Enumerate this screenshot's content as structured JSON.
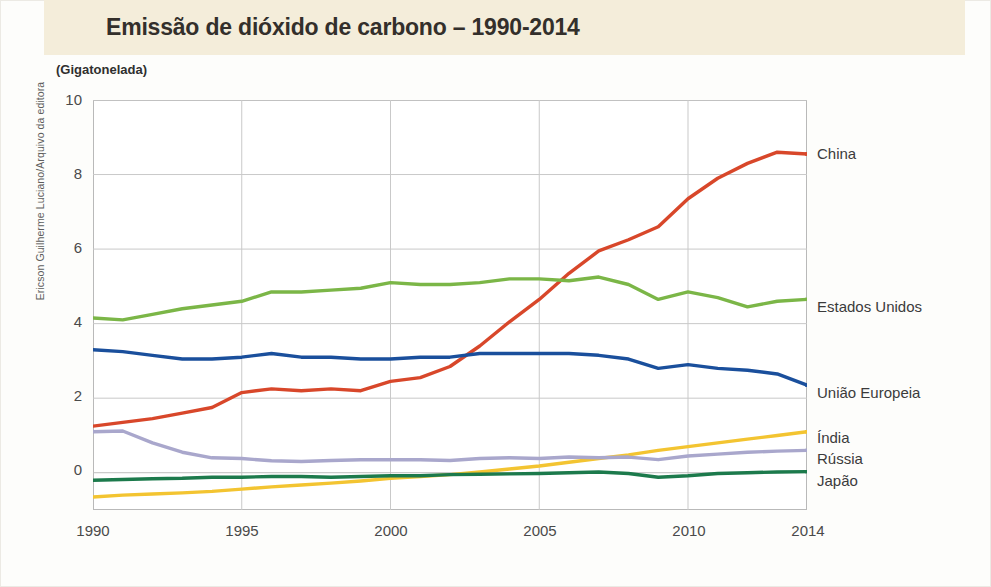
{
  "header": {
    "title": "Emissão de dióxido de carbono – 1990-2014",
    "band_color": "#f4edda"
  },
  "credit": "Ericson Guilherme Luciano/Arquivo da editora",
  "unit_caption": "(Gigatonelada)",
  "axis": {
    "y_ticks": [
      "0",
      "2",
      "4",
      "6",
      "8",
      "10"
    ],
    "x_ticks": [
      "1990",
      "1995",
      "2000",
      "2005",
      "2010",
      "2014"
    ]
  },
  "series_labels": {
    "china": "China",
    "estados_unidos": "Estados Unidos",
    "uniao_europeia": "União Europeia",
    "india": "Índia",
    "russia": "Rússia",
    "japao": "Japão"
  },
  "chart_data": {
    "type": "line",
    "title": "Emissão de dióxido de carbono – 1990-2014",
    "subtitle": "(Gigatonelada)",
    "xlabel": "",
    "ylabel": "(Gigatonelada)",
    "xlim": [
      1990,
      2014
    ],
    "ylim": [
      -1.0,
      10
    ],
    "yticks": [
      0,
      2,
      4,
      6,
      8,
      10
    ],
    "xticks": [
      1990,
      1995,
      2000,
      2005,
      2010,
      2014
    ],
    "grid": true,
    "legend_position": "right-inline-labels",
    "x": [
      1990,
      1991,
      1992,
      1993,
      1994,
      1995,
      1996,
      1997,
      1998,
      1999,
      2000,
      2001,
      2002,
      2003,
      2004,
      2005,
      2006,
      2007,
      2008,
      2009,
      2010,
      2011,
      2012,
      2013,
      2014
    ],
    "series": [
      {
        "name": "China",
        "color": "#d8472a",
        "values": [
          1.25,
          1.35,
          1.45,
          1.6,
          1.75,
          2.15,
          2.25,
          2.2,
          2.25,
          2.2,
          2.45,
          2.55,
          2.85,
          3.4,
          4.05,
          4.65,
          5.35,
          5.95,
          6.25,
          6.6,
          7.35,
          7.9,
          8.3,
          8.6,
          8.55
        ]
      },
      {
        "name": "Estados Unidos",
        "color": "#7bb647",
        "values": [
          4.15,
          4.1,
          4.25,
          4.4,
          4.5,
          4.6,
          4.85,
          4.85,
          4.9,
          4.95,
          5.1,
          5.05,
          5.05,
          5.1,
          5.2,
          5.2,
          5.15,
          5.25,
          5.05,
          4.65,
          4.85,
          4.7,
          4.45,
          4.6,
          4.65
        ]
      },
      {
        "name": "União Europeia",
        "color": "#1a4f9c",
        "values": [
          3.3,
          3.25,
          3.15,
          3.05,
          3.05,
          3.1,
          3.2,
          3.1,
          3.1,
          3.05,
          3.05,
          3.1,
          3.1,
          3.2,
          3.2,
          3.2,
          3.2,
          3.15,
          3.05,
          2.8,
          2.9,
          2.8,
          2.75,
          2.65,
          2.35
        ]
      },
      {
        "name": "Índia",
        "color": "#f3c431",
        "values": [
          -0.65,
          -0.6,
          -0.57,
          -0.54,
          -0.5,
          -0.44,
          -0.38,
          -0.33,
          -0.28,
          -0.22,
          -0.15,
          -0.1,
          -0.05,
          0.02,
          0.1,
          0.18,
          0.28,
          0.38,
          0.48,
          0.6,
          0.7,
          0.8,
          0.9,
          1.0,
          1.1
        ]
      },
      {
        "name": "Rússia",
        "color": "#a9a7cc",
        "values": [
          1.1,
          1.12,
          0.8,
          0.55,
          0.4,
          0.38,
          0.32,
          0.3,
          0.33,
          0.35,
          0.35,
          0.35,
          0.33,
          0.38,
          0.4,
          0.38,
          0.42,
          0.4,
          0.42,
          0.35,
          0.45,
          0.5,
          0.55,
          0.58,
          0.6
        ]
      },
      {
        "name": "Japão",
        "color": "#1c7a4c",
        "values": [
          -0.2,
          -0.18,
          -0.16,
          -0.15,
          -0.12,
          -0.12,
          -0.1,
          -0.1,
          -0.12,
          -0.1,
          -0.08,
          -0.08,
          -0.05,
          -0.04,
          -0.03,
          -0.02,
          0.0,
          0.02,
          -0.02,
          -0.12,
          -0.08,
          -0.02,
          0.0,
          0.02,
          0.03
        ]
      }
    ]
  }
}
